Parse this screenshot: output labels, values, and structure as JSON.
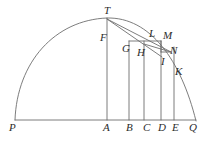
{
  "figure": {
    "kind": "geometric-diagram",
    "width": 212,
    "height": 149,
    "background_color": "#ffffff",
    "stroke_color": "#6e6e6e",
    "label_color": "#2b2b2b",
    "stroke_width": 0.9
  },
  "baseline": {
    "name": "PQ",
    "x1": 15,
    "y1": 120,
    "x2": 196,
    "y2": 120
  },
  "arc": {
    "name": "PTQ",
    "start_x": 15,
    "start_y": 120,
    "apex_x": 107,
    "apex_y": 18,
    "end_x": 196,
    "end_y": 121,
    "path": "M 15 120 C 17 62 55 20 107 18 C 150 17 181 60 196 121"
  },
  "verticals": [
    {
      "name": "TA",
      "x": 107,
      "y_top": 18,
      "y_bottom": 120
    },
    {
      "name": "GB",
      "x": 129,
      "y_top": 41,
      "y_bottom": 120
    },
    {
      "name": "HC",
      "x": 144,
      "y_top": 41,
      "y_bottom": 120
    },
    {
      "name": "MD",
      "x": 161,
      "y_top": 41,
      "y_bottom": 120
    },
    {
      "name": "KE",
      "x": 174,
      "y_top": 47,
      "y_bottom": 120
    }
  ],
  "segments": [
    {
      "name": "GM-horizontal",
      "x1": 129,
      "y1": 41,
      "x2": 161,
      "y2": 41
    },
    {
      "name": "MN-vertical",
      "x1": 161,
      "y1": 41,
      "x2": 161,
      "y2": 52
    },
    {
      "name": "T-to-N-chord",
      "x1": 107,
      "y1": 19,
      "x2": 171,
      "y2": 52
    },
    {
      "name": "T-to-I-chord",
      "x1": 107,
      "y1": 19,
      "x2": 162,
      "y2": 57
    },
    {
      "name": "H-to-N-chord",
      "x1": 144,
      "y1": 44,
      "x2": 171,
      "y2": 52
    },
    {
      "name": "N-tick",
      "x1": 161,
      "y1": 52,
      "x2": 171,
      "y2": 52
    }
  ],
  "labels": [
    {
      "id": "T",
      "text": "T",
      "x": 104,
      "y": 5,
      "anchor": "apex-of-arc"
    },
    {
      "id": "F",
      "text": "F",
      "x": 100,
      "y": 32,
      "anchor": "on-vertical-TA"
    },
    {
      "id": "G",
      "text": "G",
      "x": 122,
      "y": 43,
      "anchor": "top-of-vertical-GB"
    },
    {
      "id": "L",
      "text": "L",
      "x": 149,
      "y": 28,
      "anchor": "on-arc"
    },
    {
      "id": "M",
      "text": "M",
      "x": 163,
      "y": 30,
      "anchor": "top-right-corner"
    },
    {
      "id": "H",
      "text": "H",
      "x": 137,
      "y": 47,
      "anchor": "on-vertical-HC"
    },
    {
      "id": "N",
      "text": "N",
      "x": 170,
      "y": 45,
      "anchor": "on-arc"
    },
    {
      "id": "I",
      "text": "I",
      "x": 161,
      "y": 56,
      "anchor": "below-N"
    },
    {
      "id": "K",
      "text": "K",
      "x": 175,
      "y": 66,
      "anchor": "on-vertical-KE"
    },
    {
      "id": "P",
      "text": "P",
      "x": 9,
      "y": 122,
      "anchor": "left-end-of-baseline"
    },
    {
      "id": "A",
      "text": "A",
      "x": 103,
      "y": 122,
      "anchor": "foot-of-TA"
    },
    {
      "id": "B",
      "text": "B",
      "x": 126,
      "y": 122,
      "anchor": "foot-of-GB"
    },
    {
      "id": "C",
      "text": "C",
      "x": 143,
      "y": 122,
      "anchor": "foot-of-HC"
    },
    {
      "id": "D",
      "text": "D",
      "x": 158,
      "y": 122,
      "anchor": "foot-of-MD"
    },
    {
      "id": "E",
      "text": "E",
      "x": 172,
      "y": 122,
      "anchor": "foot-of-KE"
    },
    {
      "id": "Q",
      "text": "Q",
      "x": 189,
      "y": 122,
      "anchor": "right-end-of-baseline"
    }
  ]
}
